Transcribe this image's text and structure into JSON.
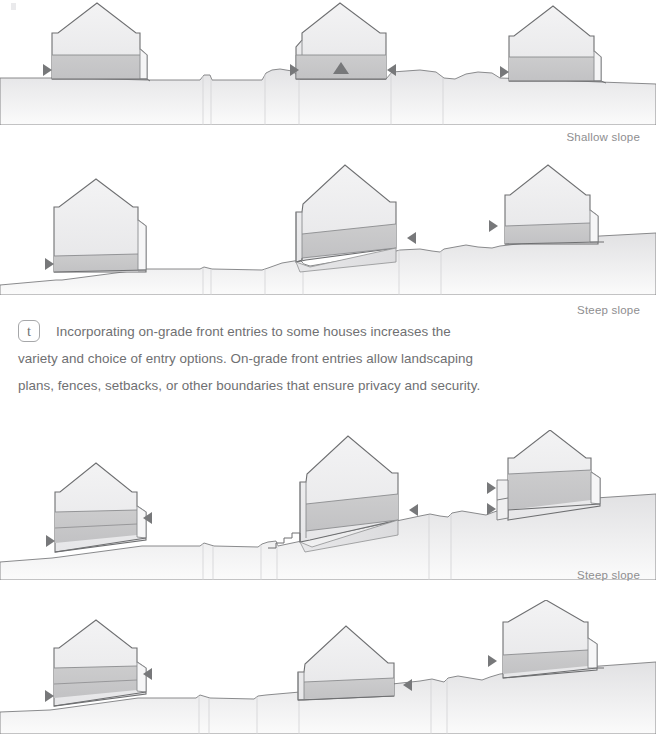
{
  "document": {
    "kind": "architectural-section-diagram",
    "title": "On-grade front entries on sloping sites",
    "background_color": "#ffffff"
  },
  "palette": {
    "outline": "#6e6f71",
    "outline_soft": "#9a9b9d",
    "house_upper_fill": "#ececee",
    "house_band_fill": "#c7c7c8",
    "ground_fill": "#e6e6e7",
    "ground_fill_dark": "#d8d8da",
    "arrow_fill": "#77787a",
    "text": "#6f7072",
    "label_text": "#8e8e90"
  },
  "note": {
    "badge": "t",
    "text": "Incorporating on-grade front entries to some houses increases the variety and choice of entry options. On-grade front entries allow landscaping plans, fences, setbacks, or other boundaries that ensure privacy and security."
  },
  "labels": [
    {
      "id": "label-shallow-slope",
      "text": "Shallow slope",
      "row_after": 1,
      "x": 569,
      "y": 132
    },
    {
      "id": "label-steep-slope-1",
      "text": "Steep slope",
      "row_after": 2,
      "x": 583,
      "y": 305
    },
    {
      "id": "label-steep-slope-2",
      "text": "Steep slope",
      "row_after": 3,
      "x": 583,
      "y": 570
    }
  ],
  "rows": [
    {
      "id": "row-1",
      "name": "shallow-slope-row",
      "slope_type": "Shallow slope",
      "y": 0,
      "height": 120,
      "terrain": "nearly flat with gentle undulations",
      "house_count": 3,
      "houses": [
        {
          "id": "house-1-1",
          "position": "left",
          "entry_arrows": [
            "left"
          ],
          "center_marker": false
        },
        {
          "id": "house-1-2",
          "position": "center",
          "entry_arrows": [
            "left",
            "right"
          ],
          "center_marker": true
        },
        {
          "id": "house-1-3",
          "position": "right",
          "entry_arrows": [
            "left"
          ],
          "center_marker": false
        }
      ]
    },
    {
      "id": "row-2",
      "name": "steep-slope-row-a",
      "slope_type": "Steep slope",
      "y": 150,
      "height": 145,
      "terrain": "rising slope left to right",
      "house_count": 3,
      "houses": [
        {
          "id": "house-2-1",
          "position": "left",
          "entry_arrows": [
            "left"
          ],
          "center_marker": false
        },
        {
          "id": "house-2-2",
          "position": "center",
          "entry_arrows": [
            "right"
          ],
          "center_marker": false
        },
        {
          "id": "house-2-3",
          "position": "right",
          "entry_arrows": [
            "left"
          ],
          "center_marker": false
        }
      ]
    },
    {
      "id": "row-3",
      "name": "steep-slope-row-b",
      "slope_type": "Steep slope",
      "y": 430,
      "height": 145,
      "terrain": "rising slope with stepped approach",
      "house_count": 3,
      "houses": [
        {
          "id": "house-3-1",
          "position": "left",
          "entry_arrows": [
            "left",
            "right"
          ],
          "center_marker": false
        },
        {
          "id": "house-3-2",
          "position": "center",
          "entry_arrows": [
            "right"
          ],
          "center_marker": false,
          "stairs": true
        },
        {
          "id": "house-3-3",
          "position": "right",
          "entry_arrows": [
            "left-upper",
            "left-lower"
          ],
          "center_marker": false
        }
      ]
    },
    {
      "id": "row-4",
      "name": "steep-slope-row-c",
      "slope_type": "Steep slope",
      "y": 600,
      "height": 134,
      "terrain": "rising slope left to right",
      "house_count": 3,
      "houses": [
        {
          "id": "house-4-1",
          "position": "left",
          "entry_arrows": [
            "left",
            "right"
          ],
          "center_marker": false
        },
        {
          "id": "house-4-2",
          "position": "center",
          "entry_arrows": [
            "right"
          ],
          "center_marker": false
        },
        {
          "id": "house-4-3",
          "position": "right",
          "entry_arrows": [
            "left"
          ],
          "center_marker": false
        }
      ]
    }
  ]
}
